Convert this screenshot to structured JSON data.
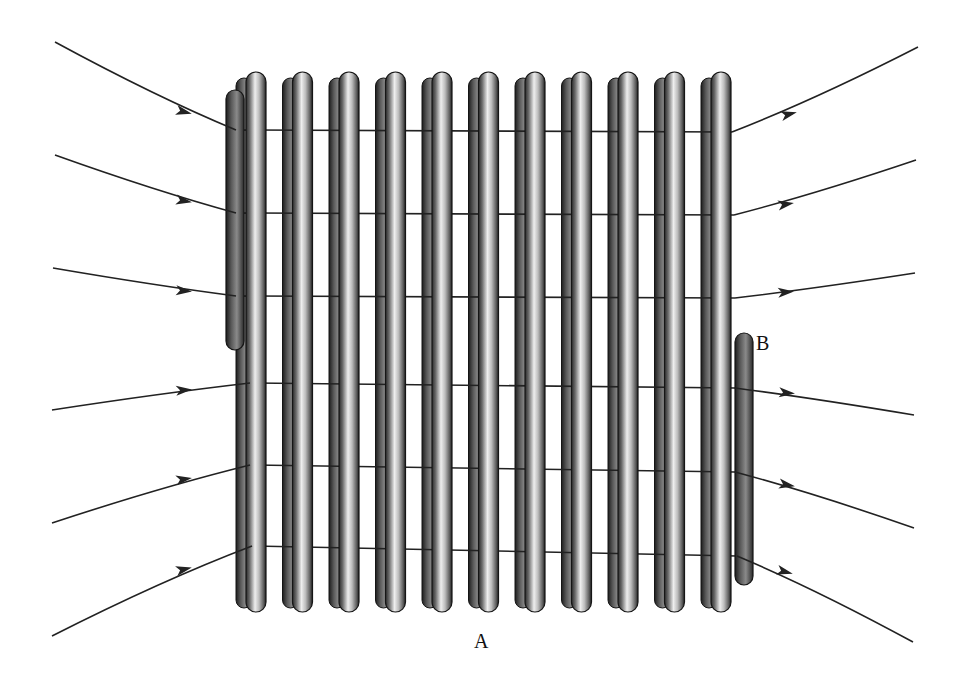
{
  "diagram": {
    "labels": {
      "terminal_a": "A",
      "terminal_b": "B"
    },
    "coil": {
      "turns": 11,
      "first_loop_x": 250,
      "loop_spacing": 46.5,
      "top_y": 72,
      "bottom_y": 612,
      "wire_width": 20,
      "colors": {
        "dark": "#2a2a2a",
        "mid": "#7a7a7a",
        "light": "#e8e8e8",
        "back_dark": "#1e1e1e",
        "back_mid": "#5a5a5a"
      }
    },
    "left_lead": {
      "x": 236,
      "top_y": 90,
      "bottom_y": 350
    },
    "right_lead_b": {
      "x": 744,
      "top_y": 333,
      "bottom_y": 585
    },
    "field_lines": {
      "color": "#222222",
      "direction": "left-to-right",
      "count": 6,
      "left": [
        {
          "start": [
            55,
            42
          ],
          "end": [
            236,
            130
          ],
          "arrow_at": [
            185,
            112
          ]
        },
        {
          "start": [
            55,
            155
          ],
          "end": [
            236,
            213
          ],
          "arrow_at": [
            185,
            201
          ]
        },
        {
          "start": [
            53,
            268
          ],
          "end": [
            236,
            296
          ],
          "arrow_at": [
            185,
            291
          ]
        },
        {
          "start": [
            52,
            410
          ],
          "end": [
            250,
            383
          ],
          "arrow_at": [
            185,
            390
          ]
        },
        {
          "start": [
            52,
            523
          ],
          "end": [
            250,
            465
          ],
          "arrow_at": [
            185,
            479
          ]
        },
        {
          "start": [
            52,
            636
          ],
          "end": [
            252,
            546
          ],
          "arrow_at": [
            185,
            569
          ]
        }
      ],
      "right": [
        {
          "start": [
            732,
            132
          ],
          "end": [
            918,
            47
          ],
          "arrow_at": [
            790,
            114
          ]
        },
        {
          "start": [
            734,
            215
          ],
          "end": [
            916,
            160
          ],
          "arrow_at": [
            787,
            204
          ]
        },
        {
          "start": [
            735,
            298
          ],
          "end": [
            915,
            273
          ],
          "arrow_at": [
            787,
            292
          ]
        },
        {
          "start": [
            735,
            388
          ],
          "end": [
            914,
            415
          ],
          "arrow_at": [
            788,
            393
          ]
        },
        {
          "start": [
            735,
            472
          ],
          "end": [
            914,
            528
          ],
          "arrow_at": [
            788,
            485
          ]
        },
        {
          "start": [
            737,
            556
          ],
          "end": [
            913,
            642
          ],
          "arrow_at": [
            786,
            572
          ]
        }
      ]
    }
  }
}
